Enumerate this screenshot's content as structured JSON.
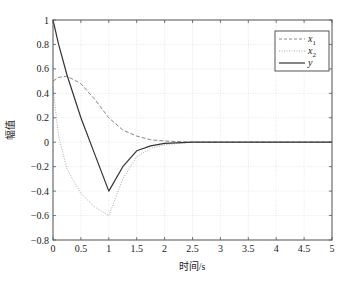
{
  "chart_data": {
    "type": "line",
    "title": "",
    "xlabel": "时间/s",
    "ylabel": "幅值",
    "xlim": [
      0,
      5
    ],
    "ylim": [
      -0.8,
      1
    ],
    "grid": true,
    "legend_position": "upper right",
    "xticks": [
      "0",
      "0.5",
      "1",
      "1.5",
      "2",
      "2.5",
      "3",
      "3.5",
      "4",
      "4.5",
      "5"
    ],
    "yticks": [
      "−0.8",
      "−0.6",
      "−0.4",
      "−0.2",
      "0",
      "0.2",
      "0.4",
      "0.6",
      "0.8",
      "1"
    ],
    "x": [
      0,
      0.1,
      0.25,
      0.5,
      0.75,
      1.0,
      1.25,
      1.5,
      1.75,
      2.0,
      2.5,
      3,
      3.5,
      4,
      4.5,
      5
    ],
    "series": [
      {
        "name": "x1",
        "style": "dashed",
        "color": "#888888",
        "values": [
          0.5,
          0.53,
          0.54,
          0.48,
          0.35,
          0.2,
          0.1,
          0.05,
          0.02,
          0.01,
          0.0,
          0.0,
          0.0,
          0.0,
          0.0,
          0.0
        ]
      },
      {
        "name": "x2",
        "style": "dotted",
        "color": "#aaaaaa",
        "values": [
          0.45,
          0.05,
          -0.22,
          -0.42,
          -0.53,
          -0.6,
          -0.3,
          -0.12,
          -0.05,
          -0.02,
          0.0,
          0.0,
          0.0,
          0.0,
          0.0,
          0.0
        ]
      },
      {
        "name": "y",
        "style": "solid",
        "color": "#333333",
        "values": [
          1.0,
          0.8,
          0.55,
          0.2,
          -0.1,
          -0.4,
          -0.2,
          -0.07,
          -0.03,
          -0.01,
          0.0,
          0.0,
          0.0,
          0.0,
          0.0,
          0.0
        ]
      }
    ]
  },
  "legend": {
    "items": [
      {
        "label": "x",
        "sub": "1"
      },
      {
        "label": "x",
        "sub": "2"
      },
      {
        "label": "y",
        "sub": ""
      }
    ]
  }
}
